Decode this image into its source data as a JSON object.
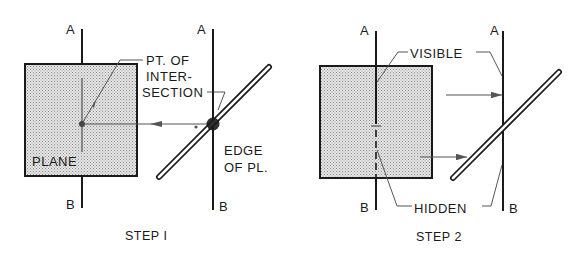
{
  "figure": {
    "steps": [
      {
        "caption": "STEP I",
        "front_view": {
          "line_top_label": "A",
          "line_bottom_label": "B",
          "plane_label": "PLANE"
        },
        "edge_view": {
          "line_top_label": "A",
          "line_bottom_label": "B",
          "edge_label_line1": "EDGE",
          "edge_label_line2": "OF PL."
        },
        "callout": {
          "line1": "PT. OF",
          "line2": "INTER-",
          "line3": "SECTION"
        }
      },
      {
        "caption": "STEP 2",
        "front_view": {
          "line_top_label": "A",
          "line_bottom_label": "B"
        },
        "edge_view": {
          "line_top_label": "A",
          "line_bottom_label": "B"
        },
        "visible_label": "VISIBLE",
        "hidden_label": "HIDDEN"
      }
    ],
    "colors": {
      "ink": "#1a1a1a",
      "projection": "#555555",
      "plane_fill": "#d9d9d9",
      "background": "#ffffff"
    }
  }
}
